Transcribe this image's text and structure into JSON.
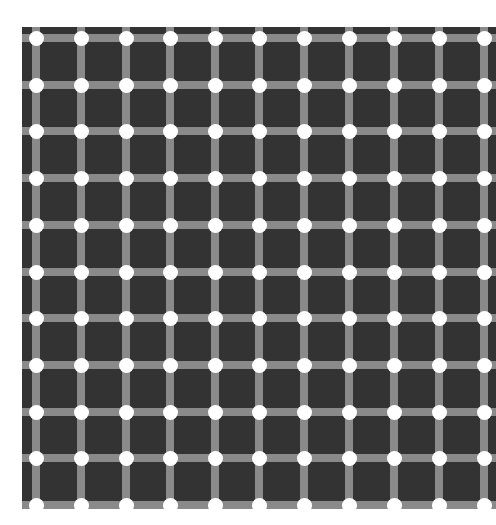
{
  "figure": {
    "type": "scintillating-grid-illusion",
    "background_color": "#333333",
    "line_color": "#8a8a8a",
    "dot_color": "#ffffff",
    "page_background": "#ffffff",
    "columns_x": [
      36,
      81,
      126,
      170,
      215,
      259,
      304,
      349,
      394,
      439,
      484
    ],
    "rows_y": [
      38,
      85,
      131,
      178,
      225,
      272,
      318,
      365,
      412,
      458,
      505
    ],
    "line_width": 8,
    "dot_diameter": 15,
    "grid_bounds": {
      "left": 22,
      "top": 27,
      "right": 496,
      "bottom": 509
    }
  }
}
